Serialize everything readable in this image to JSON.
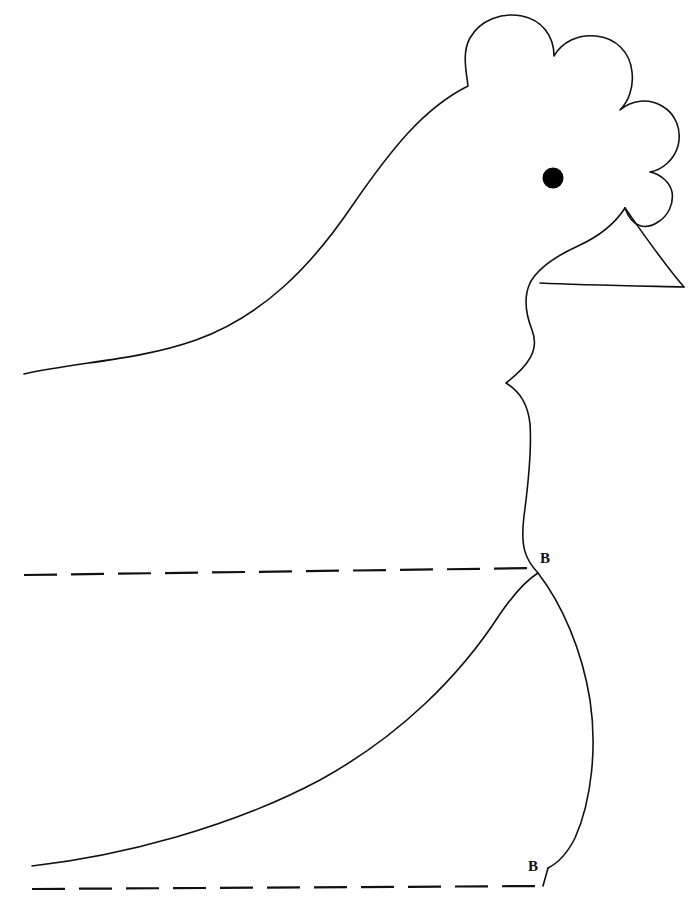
{
  "document": {
    "kind": "sewing-pattern-template",
    "subject": "hen-head-and-breast",
    "canvas": {
      "width": 700,
      "height": 899
    },
    "background_color": "#ffffff",
    "ink_color": "#111111",
    "stroke_width": 1.6
  },
  "labels": {
    "notch_upper": "B",
    "notch_lower": "B"
  },
  "features": {
    "eye": {
      "name": "eye",
      "fill": "#000000",
      "cx": 553,
      "cy": 178,
      "r": 10.5
    },
    "comb": {
      "name": "comb",
      "lobes": 3,
      "description": "three rounded comb lobes decreasing in size toward the rear"
    },
    "beak": {
      "name": "beak",
      "description": "triangular beak with upper and lower mandible lines meeting at the tip",
      "tip_x": 684,
      "tip_y": 287
    },
    "body_outline": {
      "name": "body-outline",
      "description": "back and neck sweep from lower left up over the head, down the breast to the lower edge"
    }
  },
  "guides": {
    "dashed_upper": {
      "name": "upper-fold-guide",
      "style": "dashed",
      "x_start": 24,
      "x_end": 538,
      "y_start": 575,
      "y_end": 568,
      "dash": "33 14"
    },
    "dashed_lower": {
      "name": "lower-fold-guide",
      "style": "dashed",
      "x_start": 32,
      "x_end": 543,
      "y_start": 889,
      "y_end": 886,
      "dash": "33 14"
    }
  },
  "paths": {
    "back_and_comb": "M 24,374 C 78,362 140,360 196,340 C 262,316 310,268 352,206 C 392,148 424,108 468,86 C 466,70 462,52 470,38 C 480,20 502,12 522,16 C 542,20 554,36 554,56 C 562,42 578,34 596,36 C 616,38 630,52 632,72 C 634,88 628,102 620,110 C 632,100 648,98 662,106 C 676,114 682,130 678,146 C 674,160 662,170 650,172 C 660,174 670,182 672,192 C 674,204 668,216 658,222 C 646,230 632,228 625,208",
    "beak_upper": "M 625,208 C 642,232 664,264 684,287",
    "beak_lower": "M 540,283 C 580,285 640,286 684,287",
    "face_and_neck": "M 625,208 C 616,222 600,236 578,246 C 556,256 538,268 530,283 C 524,296 525,312 532,330 C 540,350 528,366 506,383 C 520,392 528,404 530,424 C 532,452 528,486 524,516 C 520,548 526,560 538,573",
    "breast_right": "M 538,573 C 562,604 582,650 590,700 C 597,746 592,800 575,838 C 566,856 556,864 548,868",
    "breast_inner": "M 32,866 C 120,856 230,828 320,780 C 400,736 460,676 500,614 C 518,588 530,578 538,573",
    "bottom_join": "M 548,868 L 543,886"
  }
}
